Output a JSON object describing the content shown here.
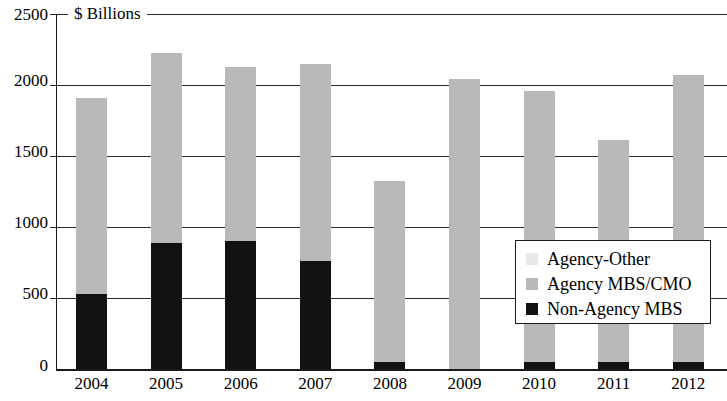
{
  "chart_data": {
    "type": "bar",
    "subtype": "stacked",
    "title": "",
    "unit_caption": "$ Billions",
    "xlabel": "",
    "ylabel": "$ Billions",
    "ylim": [
      0,
      2500
    ],
    "yticks": [
      0,
      500,
      1000,
      1500,
      2000,
      2500
    ],
    "ytick_labels": [
      "0",
      "500",
      "1000",
      "1500",
      "2000",
      "2500"
    ],
    "grid": true,
    "legend_position": "inside-right",
    "categories": [
      "2004",
      "2005",
      "2006",
      "2007",
      "2008",
      "2009",
      "2010",
      "2011",
      "2012"
    ],
    "series": [
      {
        "name": "Non-Agency MBS",
        "color": "#111111",
        "values": [
          530,
          890,
          905,
          760,
          50,
          0,
          50,
          50,
          50
        ]
      },
      {
        "name": "Agency MBS/CMO",
        "color": "#b9b9b9",
        "values": [
          1380,
          1335,
          1225,
          1390,
          1275,
          2045,
          1910,
          1565,
          2020
        ]
      },
      {
        "name": "Agency-Other",
        "color": "#e9e9e9",
        "values": [
          0,
          0,
          0,
          0,
          0,
          0,
          0,
          0,
          0
        ]
      }
    ],
    "totals": [
      1910,
      2225,
      2130,
      2150,
      1325,
      2045,
      1960,
      1615,
      2070
    ]
  },
  "legend": {
    "items": [
      {
        "label": "Agency-Other",
        "color": "#e9e9e9"
      },
      {
        "label": "Agency MBS/CMO",
        "color": "#b9b9b9"
      },
      {
        "label": "Non-Agency MBS",
        "color": "#111111"
      }
    ]
  }
}
